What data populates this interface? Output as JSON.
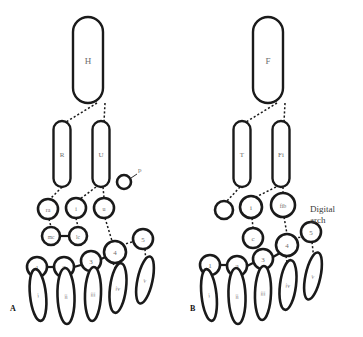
{
  "figure": {
    "type": "anatomical-diagram",
    "panels": [
      {
        "id": "A",
        "label": "A",
        "label_pos": {
          "x": 10,
          "y": 311
        },
        "annotation": null,
        "elements": [
          {
            "name": "humerus",
            "label": "H",
            "shape": "stadium",
            "x": 88,
            "y": 60,
            "w": 30,
            "h": 86,
            "font": 9
          },
          {
            "name": "radius",
            "label": "R",
            "shape": "stadium",
            "x": 62,
            "y": 154,
            "w": 17,
            "h": 66,
            "font": 7
          },
          {
            "name": "ulna",
            "label": "U",
            "shape": "stadium",
            "x": 101,
            "y": 154,
            "w": 17,
            "h": 66,
            "font": 7
          },
          {
            "name": "pisiform",
            "label": "",
            "shape": "circle",
            "x": 124,
            "y": 182,
            "r": 7,
            "font": 6
          },
          {
            "name": "radiale",
            "label": "ra",
            "shape": "circle",
            "x": 48,
            "y": 209,
            "r": 10,
            "font": 6
          },
          {
            "name": "intermedium",
            "label": "i",
            "shape": "circle",
            "x": 76,
            "y": 208,
            "r": 10,
            "font": 6
          },
          {
            "name": "ulnare",
            "label": "u",
            "shape": "circle",
            "x": 104,
            "y": 208,
            "r": 10,
            "font": 6
          },
          {
            "name": "medial-centrale",
            "label": "mc",
            "shape": "circle",
            "x": 51,
            "y": 236,
            "r": 9,
            "font": 5.5
          },
          {
            "name": "lateral-centrale",
            "label": "lc",
            "shape": "circle",
            "x": 78,
            "y": 236,
            "r": 9,
            "font": 5.5
          },
          {
            "name": "distal-carpal-4",
            "label": "4",
            "shape": "circle",
            "x": 115,
            "y": 252,
            "r": 11,
            "font": 7
          },
          {
            "name": "distal-carpal-5",
            "label": "5",
            "shape": "circle",
            "x": 143,
            "y": 239,
            "r": 10,
            "font": 7
          },
          {
            "name": "distal-carpal-1",
            "label": "1",
            "shape": "circle",
            "x": 37,
            "y": 267,
            "r": 10,
            "font": 7
          },
          {
            "name": "distal-carpal-2",
            "label": "2",
            "shape": "circle",
            "x": 64,
            "y": 267,
            "r": 10,
            "font": 7
          },
          {
            "name": "distal-carpal-3",
            "label": "3",
            "shape": "circle",
            "x": 91,
            "y": 261,
            "r": 10,
            "font": 7
          },
          {
            "name": "metacarpal-i",
            "label": "i",
            "shape": "ellipse",
            "x": 38,
            "y": 295,
            "rx": 8,
            "ry": 26,
            "rot": -6,
            "font": 6
          },
          {
            "name": "metacarpal-ii",
            "label": "ii",
            "shape": "ellipse",
            "x": 66,
            "y": 296,
            "rx": 8.5,
            "ry": 28,
            "rot": -2,
            "font": 6
          },
          {
            "name": "metacarpal-iii",
            "label": "iii",
            "shape": "ellipse",
            "x": 93,
            "y": 294,
            "rx": 8,
            "ry": 27,
            "rot": 2,
            "font": 6
          },
          {
            "name": "metacarpal-iv",
            "label": "iv",
            "shape": "ellipse",
            "x": 118,
            "y": 288,
            "rx": 8,
            "ry": 25,
            "rot": 7,
            "font": 6
          },
          {
            "name": "metacarpal-v",
            "label": "v",
            "shape": "ellipse",
            "x": 145,
            "y": 280,
            "rx": 7.5,
            "ry": 24,
            "rot": 12,
            "font": 6
          }
        ],
        "connectors": [
          {
            "from": [
              97,
              103
            ],
            "to": [
              66,
              122
            ],
            "style": "dashed"
          },
          {
            "from": [
              105,
              103
            ],
            "to": [
              104,
              122
            ],
            "style": "dashed"
          },
          {
            "from": [
              62,
              187
            ],
            "to": [
              50,
              199
            ],
            "style": "dashed"
          },
          {
            "from": [
              96,
              187
            ],
            "to": [
              80,
              199
            ],
            "style": "dashed"
          },
          {
            "from": [
              103,
              187
            ],
            "to": [
              104,
              198
            ],
            "style": "dashed"
          },
          {
            "from": [
              49,
              219
            ],
            "to": [
              51,
              227
            ],
            "style": "dashed"
          },
          {
            "from": [
              76,
              218
            ],
            "to": [
              78,
              227
            ],
            "style": "dashed"
          },
          {
            "from": [
              60,
              236
            ],
            "to": [
              69,
              236
            ],
            "style": "solid"
          },
          {
            "from": [
              105,
              218
            ],
            "to": [
              112,
              241
            ],
            "style": "dashed"
          },
          {
            "from": [
              122,
              245
            ],
            "to": [
              135,
              241
            ],
            "style": "dashed"
          },
          {
            "from": [
              47,
              267
            ],
            "to": [
              54,
              267
            ],
            "style": "solid"
          },
          {
            "from": [
              74,
              267
            ],
            "to": [
              81,
              265
            ],
            "style": "solid"
          },
          {
            "from": [
              101,
              259
            ],
            "to": [
              108,
              256
            ],
            "style": "solid"
          },
          {
            "from": [
              37,
              277
            ],
            "to": [
              38,
              285
            ],
            "style": "dashed"
          },
          {
            "from": [
              64,
              277
            ],
            "to": [
              66,
              286
            ],
            "style": "dashed"
          },
          {
            "from": [
              91,
              271
            ],
            "to": [
              93,
              283
            ],
            "style": "dashed"
          },
          {
            "from": [
              113,
              263
            ],
            "to": [
              117,
              272
            ],
            "style": "dashed"
          },
          {
            "from": [
              145,
              249
            ],
            "to": [
              146,
              264
            ],
            "style": "dashed"
          }
        ],
        "free_labels": [
          {
            "name": "pisiform-label",
            "text": "p",
            "x": 138,
            "y": 172,
            "leader": {
              "from": [
                131,
                178
              ],
              "to": [
                137,
                174
              ]
            }
          }
        ]
      },
      {
        "id": "B",
        "label": "B",
        "label_pos": {
          "x": 190,
          "y": 311
        },
        "annotation": {
          "name": "digital-arch-label",
          "lines": [
            "Digital",
            "arch"
          ],
          "x": 310,
          "y": 212
        },
        "elements": [
          {
            "name": "femur",
            "label": "F",
            "shape": "stadium",
            "x": 268,
            "y": 60,
            "w": 30,
            "h": 86,
            "font": 9
          },
          {
            "name": "tibia",
            "label": "T",
            "shape": "stadium",
            "x": 242,
            "y": 154,
            "w": 17,
            "h": 66,
            "font": 7
          },
          {
            "name": "fibula",
            "label": "Fi",
            "shape": "stadium",
            "x": 281,
            "y": 154,
            "w": 17,
            "h": 66,
            "font": 7
          },
          {
            "name": "tibiale",
            "label": "",
            "shape": "circle",
            "x": 224,
            "y": 210,
            "r": 9,
            "font": 6
          },
          {
            "name": "intermedium",
            "label": "i",
            "shape": "circle",
            "x": 251,
            "y": 207,
            "r": 11,
            "font": 7
          },
          {
            "name": "fibulare",
            "label": "fib",
            "shape": "circle",
            "x": 283,
            "y": 205,
            "r": 12,
            "font": 6
          },
          {
            "name": "centrale",
            "label": "c",
            "shape": "circle",
            "x": 253,
            "y": 238,
            "r": 10,
            "font": 7
          },
          {
            "name": "distal-tarsal-4",
            "label": "4",
            "shape": "circle",
            "x": 287,
            "y": 245,
            "r": 11,
            "font": 7
          },
          {
            "name": "distal-tarsal-5",
            "label": "5",
            "shape": "circle",
            "x": 311,
            "y": 232,
            "r": 10,
            "font": 7
          },
          {
            "name": "distal-tarsal-1",
            "label": "1",
            "shape": "circle",
            "x": 210,
            "y": 265,
            "r": 10,
            "font": 7
          },
          {
            "name": "distal-tarsal-2",
            "label": "2",
            "shape": "circle",
            "x": 237,
            "y": 266,
            "r": 10,
            "font": 7
          },
          {
            "name": "distal-tarsal-3",
            "label": "3",
            "shape": "circle",
            "x": 263,
            "y": 259,
            "r": 10,
            "font": 7
          },
          {
            "name": "metatarsal-i",
            "label": "i",
            "shape": "ellipse",
            "x": 209,
            "y": 295,
            "rx": 7.5,
            "ry": 26,
            "rot": -6,
            "font": 6
          },
          {
            "name": "metatarsal-ii",
            "label": "ii",
            "shape": "ellipse",
            "x": 237,
            "y": 296,
            "rx": 8.5,
            "ry": 28,
            "rot": -2,
            "font": 6
          },
          {
            "name": "metatarsal-iii",
            "label": "iii",
            "shape": "ellipse",
            "x": 263,
            "y": 293,
            "rx": 8,
            "ry": 27,
            "rot": 2,
            "font": 6
          },
          {
            "name": "metatarsal-iv",
            "label": "iv",
            "shape": "ellipse",
            "x": 288,
            "y": 285,
            "rx": 8,
            "ry": 25,
            "rot": 7,
            "font": 6
          },
          {
            "name": "metatarsal-v",
            "label": "v",
            "shape": "ellipse",
            "x": 313,
            "y": 276,
            "rx": 7.5,
            "ry": 24,
            "rot": 12,
            "font": 6
          }
        ],
        "connectors": [
          {
            "from": [
              277,
              103
            ],
            "to": [
              246,
              122
            ],
            "style": "dashed"
          },
          {
            "from": [
              285,
              103
            ],
            "to": [
              284,
              122
            ],
            "style": "dashed"
          },
          {
            "from": [
              240,
              187
            ],
            "to": [
              227,
              201
            ],
            "style": "dashed"
          },
          {
            "from": [
              276,
              187
            ],
            "to": [
              256,
              197
            ],
            "style": "dashed"
          },
          {
            "from": [
              283,
              187
            ],
            "to": [
              283,
              193
            ],
            "style": "dashed"
          },
          {
            "from": [
              252,
              218
            ],
            "to": [
              253,
              228
            ],
            "style": "dashed"
          },
          {
            "from": [
              284,
              217
            ],
            "to": [
              287,
              234
            ],
            "style": "dashed"
          },
          {
            "from": [
              294,
              238
            ],
            "to": [
              304,
              237
            ],
            "style": "dashed"
          },
          {
            "from": [
              220,
              265
            ],
            "to": [
              227,
              265
            ],
            "style": "solid"
          },
          {
            "from": [
              247,
              266
            ],
            "to": [
              253,
              263
            ],
            "style": "solid"
          },
          {
            "from": [
              273,
              257
            ],
            "to": [
              280,
              253
            ],
            "style": "solid"
          },
          {
            "from": [
              210,
              275
            ],
            "to": [
              210,
              285
            ],
            "style": "dashed"
          },
          {
            "from": [
              237,
              276
            ],
            "to": [
              237,
              286
            ],
            "style": "dashed"
          },
          {
            "from": [
              263,
              269
            ],
            "to": [
              263,
              282
            ],
            "style": "dashed"
          },
          {
            "from": [
              286,
              256
            ],
            "to": [
              288,
              269
            ],
            "style": "dashed"
          },
          {
            "from": [
              312,
              242
            ],
            "to": [
              314,
              260
            ],
            "style": "dashed"
          }
        ],
        "free_labels": []
      }
    ]
  },
  "caption": {
    "partial_text": ""
  },
  "colors": {
    "stroke": "#1a1a1a",
    "fill": "#ffffff",
    "label_text": "#6d6d6d",
    "panel_label": "#111111",
    "annotation_text": "#3a3a3a",
    "background": "#ffffff"
  }
}
